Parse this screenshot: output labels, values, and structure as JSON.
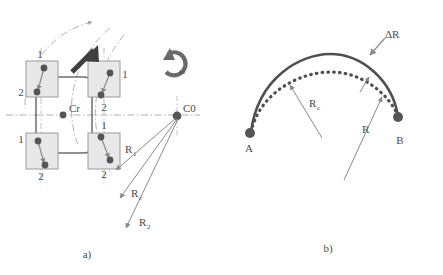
{
  "figure": {
    "panels": [
      {
        "id": "panel-a",
        "caption": "a)",
        "labels": {
          "center_of_rotation": "C0",
          "vehicle_center": "Cr",
          "angular_velocity": "ω",
          "radius_inner": "R",
          "radius_inner_sub": "1",
          "radius_center": "R",
          "radius_center_sub": "c",
          "radius_outer": "R",
          "radius_outer_sub": "2",
          "wheel_point_first": "1",
          "wheel_point_second": "2"
        },
        "wheels": [
          {
            "name": "front-left",
            "label_first": "1",
            "label_second": "2"
          },
          {
            "name": "front-right",
            "label_first": "1",
            "label_second": "2"
          },
          {
            "name": "rear-left",
            "label_first": "1",
            "label_second": "2"
          },
          {
            "name": "rear-right",
            "label_first": "1",
            "label_second": "2"
          }
        ]
      },
      {
        "id": "panel-b",
        "caption": "b)",
        "labels": {
          "start_point": "A",
          "end_point": "B",
          "arc_commanded": "R",
          "arc_commanded_sub": "c",
          "arc_actual": "R",
          "radius_delta": "ΔR"
        }
      }
    ]
  },
  "colors": {
    "ink": "#4a4a4a",
    "ink_dark": "#3a3a3a",
    "body_line": "#6e6e6e",
    "wheel_fill": "#e8e8e8",
    "wheel_stroke": "#9a9a9a",
    "marker": "#555555",
    "arrow_gray": "#8a8a8a",
    "dashdot": "#a8a8a8",
    "curve_solid": "#4f4f4f",
    "curve_dotted": "#4f4f4f",
    "thick_arrow": "#3f3f3f"
  }
}
